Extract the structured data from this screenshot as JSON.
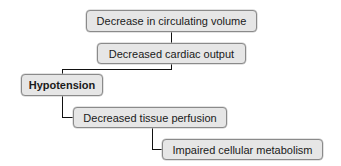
{
  "diagram": {
    "type": "flowchart-cascade",
    "nodes": [
      {
        "id": "n1",
        "label": "Decrease in circulating volume",
        "bold": false
      },
      {
        "id": "n2",
        "label": "Decreased cardiac output",
        "bold": false
      },
      {
        "id": "n3",
        "label": "Hypotension",
        "bold": true
      },
      {
        "id": "n4",
        "label": "Decreased tissue perfusion",
        "bold": false
      },
      {
        "id": "n5",
        "label": "Impaired cellular metabolism",
        "bold": false
      }
    ],
    "edges": [
      {
        "from": "n1",
        "to": "n2"
      },
      {
        "from": "n2",
        "to": "n3"
      },
      {
        "from": "n3",
        "to": "n4"
      },
      {
        "from": "n4",
        "to": "n5"
      }
    ],
    "colors": {
      "box_fill": "#e6e6e6",
      "box_border": "#8a8a8a",
      "connector": "#111111"
    }
  }
}
